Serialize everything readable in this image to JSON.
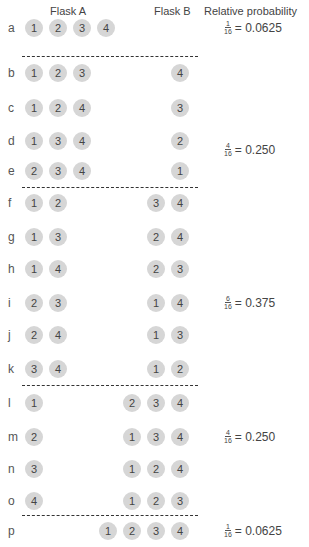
{
  "headers": {
    "flask_a": "Flask A",
    "flask_b": "Flask B",
    "probability": "Relative probability"
  },
  "rows": [
    {
      "label": "a",
      "flask_a": [
        "1",
        "2",
        "3",
        "4"
      ],
      "flask_b": []
    },
    {
      "label": "b",
      "flask_a": [
        "1",
        "2",
        "3"
      ],
      "flask_b": [
        "4"
      ]
    },
    {
      "label": "c",
      "flask_a": [
        "1",
        "2",
        "4"
      ],
      "flask_b": [
        "3"
      ]
    },
    {
      "label": "d",
      "flask_a": [
        "1",
        "3",
        "4"
      ],
      "flask_b": [
        "2"
      ]
    },
    {
      "label": "e",
      "flask_a": [
        "2",
        "3",
        "4"
      ],
      "flask_b": [
        "1"
      ]
    },
    {
      "label": "f",
      "flask_a": [
        "1",
        "2"
      ],
      "flask_b": [
        "3",
        "4"
      ]
    },
    {
      "label": "g",
      "flask_a": [
        "1",
        "3"
      ],
      "flask_b": [
        "2",
        "4"
      ]
    },
    {
      "label": "h",
      "flask_a": [
        "1",
        "4"
      ],
      "flask_b": [
        "2",
        "3"
      ]
    },
    {
      "label": "i",
      "flask_a": [
        "2",
        "3"
      ],
      "flask_b": [
        "1",
        "4"
      ]
    },
    {
      "label": "j",
      "flask_a": [
        "2",
        "4"
      ],
      "flask_b": [
        "1",
        "3"
      ]
    },
    {
      "label": "k",
      "flask_a": [
        "3",
        "4"
      ],
      "flask_b": [
        "1",
        "2"
      ]
    },
    {
      "label": "l",
      "flask_a": [
        "1"
      ],
      "flask_b": [
        "2",
        "3",
        "4"
      ]
    },
    {
      "label": "m",
      "flask_a": [
        "2"
      ],
      "flask_b": [
        "1",
        "3",
        "4"
      ]
    },
    {
      "label": "n",
      "flask_a": [
        "3"
      ],
      "flask_b": [
        "1",
        "2",
        "4"
      ]
    },
    {
      "label": "o",
      "flask_a": [
        "4"
      ],
      "flask_b": [
        "1",
        "2",
        "3"
      ]
    },
    {
      "label": "p",
      "flask_a": [],
      "flask_b": [
        "1",
        "2",
        "3",
        "4"
      ]
    }
  ],
  "groups": [
    {
      "rows": "a",
      "numerator": "1",
      "denominator": "16",
      "value": "= 0.0625"
    },
    {
      "rows": "b-e",
      "numerator": "4",
      "denominator": "16",
      "value": "= 0.250"
    },
    {
      "rows": "f-k",
      "numerator": "6",
      "denominator": "16",
      "value": "= 0.375"
    },
    {
      "rows": "l-o",
      "numerator": "4",
      "denominator": "16",
      "value": "= 0.250"
    },
    {
      "rows": "p",
      "numerator": "1",
      "denominator": "16",
      "value": "= 0.0625"
    }
  ],
  "colors": {
    "ball_fill": "#d6d6d6",
    "text": "#444444",
    "divider": "#333333"
  }
}
